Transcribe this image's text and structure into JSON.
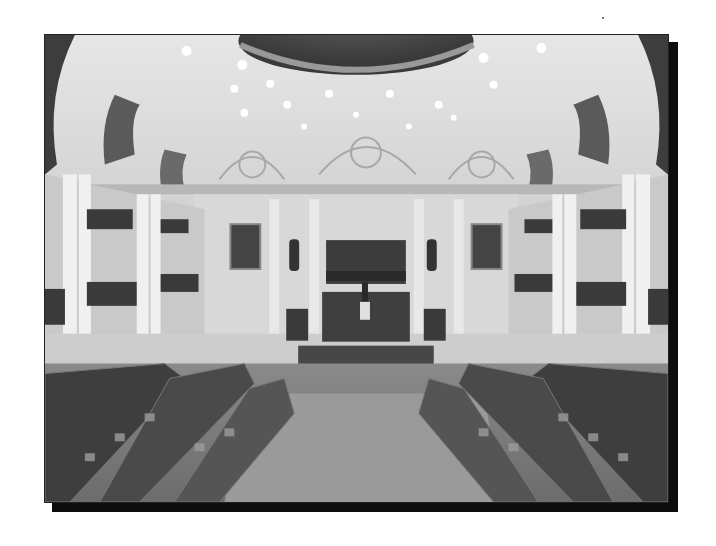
{
  "image": {
    "subject": "Grayscale photograph of a semicircular legislative chamber interior",
    "elements": {
      "ceiling_lights_count": 16,
      "central_relief_panel": "large bronze relief above the presiding dais",
      "portraits": [
        "left portrait",
        "right portrait"
      ],
      "statues": [
        "left niche statue",
        "right niche statue"
      ],
      "flag": "flag on the presiding desk",
      "seating": "curved rows of desks and chairs facing the dais"
    },
    "frame": {
      "photo_border_color": "#222222",
      "shadow_color": "#0d0d0d",
      "background_color": "#ffffff"
    }
  }
}
